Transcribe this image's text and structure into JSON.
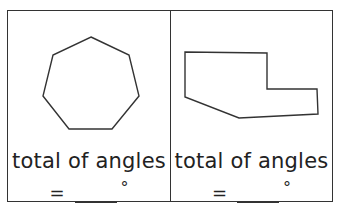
{
  "worksheet": {
    "panels": [
      {
        "shape_name": "regular heptagon",
        "shape_points": "83,26 121,44 131,85 104,118 61,118 35,85 45,44",
        "label": "total of angles",
        "equals": "=",
        "blank": "",
        "unit_symbol": "°"
      },
      {
        "shape_name": "irregular hexagon",
        "shape_points": "14,41 96,42 96,78 146,78 147,103 68,107 14,86",
        "label": "total of angles",
        "equals": "=",
        "blank": "",
        "unit_symbol": "°"
      }
    ],
    "colors": {
      "line": "#333333",
      "text": "#222222",
      "background": "#ffffff"
    }
  }
}
